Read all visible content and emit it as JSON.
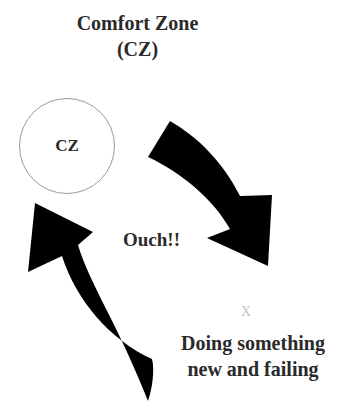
{
  "diagram": {
    "title_lines": [
      "Comfort Zone",
      "(CZ)"
    ],
    "circle": {
      "label": "CZ",
      "border_color": "#9a9a9a"
    },
    "center_label": "Ouch!!",
    "small_mark": "X",
    "bottom_lines": [
      "Doing something",
      "new and failing"
    ],
    "arrows": [
      {
        "name": "arrow-cz-to-failing",
        "direction": "clockwise, from comfort zone down to failing",
        "color": "#000000"
      },
      {
        "name": "arrow-failing-to-cz",
        "direction": "from failing back up to comfort zone",
        "color": "#000000"
      }
    ]
  }
}
